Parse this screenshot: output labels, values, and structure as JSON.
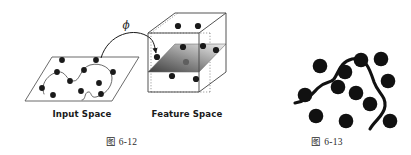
{
  "figure": {
    "background_color": "#ffffff",
    "ink_color": "#1a1a1a",
    "left_figure": {
      "caption": "图 6-12",
      "mapping_symbol": "ϕ",
      "input_space": {
        "label": "Input Space",
        "plane_shape": "parallelogram",
        "point_count": 11,
        "points": [
          {
            "x": 42,
            "y": 88
          },
          {
            "x": 57,
            "y": 72
          },
          {
            "x": 53,
            "y": 95
          },
          {
            "x": 70,
            "y": 81
          },
          {
            "x": 62,
            "y": 60
          },
          {
            "x": 81,
            "y": 91
          },
          {
            "x": 84,
            "y": 70
          },
          {
            "x": 96,
            "y": 60
          },
          {
            "x": 99,
            "y": 83
          },
          {
            "x": 101,
            "y": 94
          },
          {
            "x": 113,
            "y": 72
          }
        ],
        "boundary_curve": "closed irregular blob separating points"
      },
      "feature_space": {
        "label": "Feature Space",
        "shape": "cube",
        "hidden_edges": "dotted",
        "hyperplane": {
          "shape": "parallelogram slice",
          "gradient_from": "#4a4a4a",
          "gradient_to": "#e8e8e8"
        },
        "point_count": 9,
        "points": [
          {
            "x": 178,
            "y": 26
          },
          {
            "x": 198,
            "y": 26
          },
          {
            "x": 183,
            "y": 47
          },
          {
            "x": 203,
            "y": 46
          },
          {
            "x": 215,
            "y": 50
          },
          {
            "x": 155,
            "y": 57
          },
          {
            "x": 186,
            "y": 62
          },
          {
            "x": 172,
            "y": 75
          },
          {
            "x": 196,
            "y": 78
          }
        ]
      },
      "mapping_arrow": {
        "from_point": {
          "x": 101,
          "y": 60
        },
        "to_point": {
          "x": 157,
          "y": 56
        },
        "style": "curved arrow"
      }
    },
    "right_figure": {
      "caption": "图 6-13",
      "point_count": 12,
      "point_radius": 7.5,
      "points": [
        {
          "x": 320,
          "y": 66
        },
        {
          "x": 345,
          "y": 72
        },
        {
          "x": 361,
          "y": 60
        },
        {
          "x": 338,
          "y": 87
        },
        {
          "x": 381,
          "y": 59
        },
        {
          "x": 386,
          "y": 81
        },
        {
          "x": 304,
          "y": 95
        },
        {
          "x": 315,
          "y": 115
        },
        {
          "x": 369,
          "y": 104
        },
        {
          "x": 345,
          "y": 120
        },
        {
          "x": 389,
          "y": 120
        },
        {
          "x": 355,
          "y": 92
        }
      ],
      "curve": "thick S-shaped separating curve"
    }
  }
}
